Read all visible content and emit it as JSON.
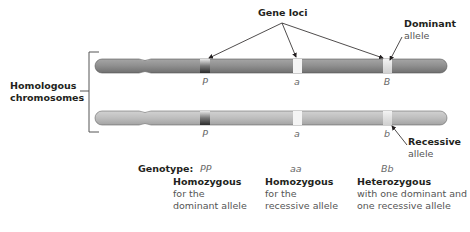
{
  "title_label": "Gene loci",
  "side_label": {
    "line1": "Homologous",
    "line2": "chromosomes"
  },
  "dominant_callout": {
    "bold": "Dominant",
    "sub": "allele"
  },
  "recessive_callout": {
    "bold": "Recessive",
    "sub": "allele"
  },
  "chromosomes": {
    "top": {
      "color": "#8f8f8f",
      "loci_letters": [
        "P",
        "a",
        "B"
      ]
    },
    "bottom": {
      "color": "#bdbdbd",
      "loci_letters": [
        "P",
        "a",
        "b"
      ]
    }
  },
  "genotype_label": "Genotype:",
  "columns": [
    {
      "genotype": "PP",
      "heading": "Homozygous",
      "line1": "for the",
      "line2": "dominant allele"
    },
    {
      "genotype": "aa",
      "heading": "Homozygous",
      "line1": "for the",
      "line2": "recessive allele"
    },
    {
      "genotype": "Bb",
      "heading": "Heterozygous",
      "line1": "with one dominant and",
      "line2": "one recessive allele"
    }
  ]
}
